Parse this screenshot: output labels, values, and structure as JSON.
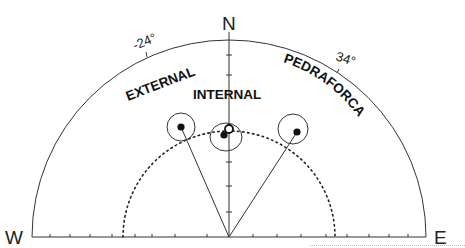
{
  "diagram": {
    "type": "equal-area stereonet (upper hemisphere half)",
    "compass": {
      "north": "N",
      "west": "W",
      "east": "E"
    },
    "angle_marks": [
      {
        "label": "-24°",
        "azimuth_deg": -24
      },
      {
        "label": "34°",
        "azimuth_deg": 34
      }
    ],
    "sites": [
      {
        "label": "EXTERNAL",
        "mean": "filled",
        "has_vector": true
      },
      {
        "label": "INTERNAL",
        "means": [
          "open",
          "filled"
        ],
        "has_vector": false
      },
      {
        "label": "PEDRAFORCA",
        "mean": "filled",
        "has_vector": true
      }
    ],
    "reference_circle": "dotted",
    "colors": {
      "ink": "#222222",
      "background": "#ffffff"
    }
  }
}
